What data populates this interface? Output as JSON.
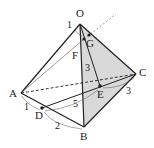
{
  "figure": {
    "type": "tetrahedron",
    "shaded_face": "OBC",
    "shade_color": "#d9d9d9",
    "line_color": "#222222",
    "points": {
      "O": {
        "label": "O",
        "x": 80,
        "y": 24
      },
      "A": {
        "label": "A",
        "x": 21,
        "y": 93
      },
      "B": {
        "label": "B",
        "x": 84,
        "y": 127
      },
      "C": {
        "label": "C",
        "x": 136,
        "y": 74
      },
      "D": {
        "label": "D",
        "x": 42,
        "y": 108
      },
      "E": {
        "label": "E",
        "x": 100,
        "y": 86
      },
      "F": {
        "label": "F",
        "x": 84,
        "y": 39
      },
      "G": {
        "label": "G",
        "x": 89,
        "y": 35
      }
    },
    "measures": {
      "OF": "1",
      "FE": "3",
      "AD": "1",
      "DB": "2",
      "DE": "5",
      "EC": "3"
    }
  }
}
